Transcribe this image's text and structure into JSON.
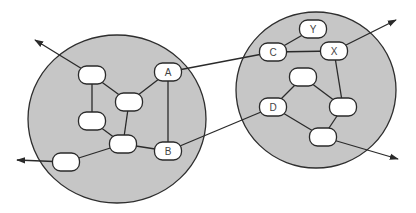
{
  "diagram": {
    "width": 416,
    "height": 213,
    "colors": {
      "region_fill": "#c6c6c6",
      "stroke": "#2a2a2a",
      "node_fill": "#ffffff",
      "background": "#ffffff"
    },
    "regions": [
      {
        "id": "left-network",
        "cx": 117,
        "cy": 119,
        "rx": 89,
        "ry": 84
      },
      {
        "id": "right-network",
        "cx": 316,
        "cy": 90,
        "rx": 80,
        "ry": 78
      }
    ],
    "node_size": {
      "w": 27,
      "h": 18
    },
    "nodes": [
      {
        "id": "L1",
        "label": "",
        "x": 92,
        "y": 75
      },
      {
        "id": "L2",
        "label": "",
        "x": 129,
        "y": 102
      },
      {
        "id": "L3",
        "label": "",
        "x": 92,
        "y": 121
      },
      {
        "id": "L4",
        "label": "",
        "x": 123,
        "y": 144
      },
      {
        "id": "L5",
        "label": "",
        "x": 66,
        "y": 162
      },
      {
        "id": "A",
        "label": "A",
        "x": 168,
        "y": 72
      },
      {
        "id": "B",
        "label": "B",
        "x": 168,
        "y": 151
      },
      {
        "id": "Y",
        "label": "Y",
        "x": 313,
        "y": 29
      },
      {
        "id": "C",
        "label": "C",
        "x": 273,
        "y": 52
      },
      {
        "id": "X",
        "label": "X",
        "x": 334,
        "y": 51
      },
      {
        "id": "R1",
        "label": "",
        "x": 303,
        "y": 77
      },
      {
        "id": "D",
        "label": "D",
        "x": 273,
        "y": 107
      },
      {
        "id": "R2",
        "label": "",
        "x": 343,
        "y": 107
      },
      {
        "id": "R3",
        "label": "",
        "x": 323,
        "y": 137
      }
    ],
    "edges": [
      [
        "L1",
        "L3"
      ],
      [
        "L1",
        "L2"
      ],
      [
        "L2",
        "A"
      ],
      [
        "L2",
        "L4"
      ],
      [
        "L3",
        "L4"
      ],
      [
        "L4",
        "L5"
      ],
      [
        "L4",
        "B"
      ],
      [
        "A",
        "B"
      ],
      [
        "A",
        "C"
      ],
      [
        "B",
        "D"
      ],
      [
        "C",
        "Y"
      ],
      [
        "C",
        "X"
      ],
      [
        "X",
        "R2"
      ],
      [
        "R1",
        "D"
      ],
      [
        "R1",
        "R2"
      ],
      [
        "R2",
        "R3"
      ],
      [
        "D",
        "R3"
      ]
    ],
    "external_arrows": [
      {
        "from": "L1",
        "to": [
          35,
          40
        ]
      },
      {
        "from": "L5",
        "to": [
          17,
          160
        ]
      },
      {
        "from": "X",
        "to": [
          396,
          20
        ]
      },
      {
        "from": "R3",
        "to": [
          398,
          159
        ]
      }
    ]
  }
}
